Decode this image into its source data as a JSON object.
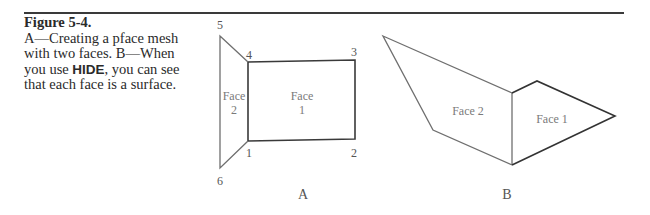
{
  "caption": {
    "figure_label": "Figure 5-4.",
    "lines": [
      "A—Creating a pface mesh",
      "with two faces. B—When",
      "you use ",
      ", you can see",
      "that each face is a surface."
    ],
    "command": "HIDE"
  },
  "diagram_a": {
    "label": "A",
    "vertices": [
      {
        "id": "1",
        "label": "1",
        "x": 248,
        "y": 141
      },
      {
        "id": "2",
        "label": "2",
        "x": 355,
        "y": 139
      },
      {
        "id": "3",
        "label": "3",
        "x": 355,
        "y": 60
      },
      {
        "id": "4",
        "label": "4",
        "x": 248,
        "y": 62
      },
      {
        "id": "5",
        "label": "5",
        "x": 220,
        "y": 36
      },
      {
        "id": "6",
        "label": "6",
        "x": 220,
        "y": 168
      }
    ],
    "faces": [
      {
        "name": "Face 1",
        "line1": "Face",
        "line2": "1"
      },
      {
        "name": "Face 2",
        "line1": "Face",
        "line2": "2"
      }
    ]
  },
  "diagram_b": {
    "label": "B",
    "faces": [
      {
        "name": "Face 2",
        "label": "Face 2"
      },
      {
        "name": "Face 1",
        "label": "Face 1"
      }
    ]
  },
  "colors": {
    "rule": "#3a3a3a",
    "outline_dark": "#333333",
    "outline_light": "#6f6f6f",
    "label_gray": "#7a7a7a",
    "text": "#2a2a2a"
  }
}
